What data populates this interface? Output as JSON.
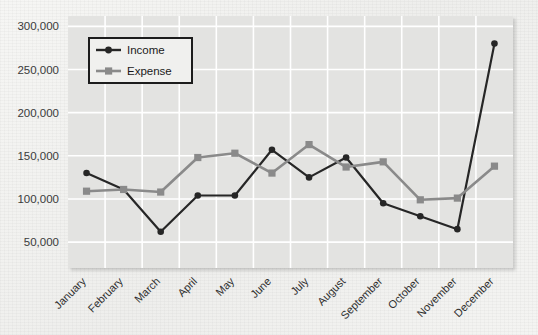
{
  "chart_data": {
    "type": "line",
    "title": "",
    "subtitle": "",
    "xlabel": "",
    "ylabel": "",
    "categories": [
      "January",
      "February",
      "March",
      "April",
      "May",
      "June",
      "July",
      "August",
      "September",
      "October",
      "November",
      "December"
    ],
    "series": [
      {
        "name": "Income",
        "color": "#262626",
        "marker": "circle",
        "values": [
          130000,
          111000,
          62000,
          104000,
          104000,
          157000,
          125000,
          148000,
          95000,
          80000,
          65000,
          280000
        ]
      },
      {
        "name": "Expense",
        "color": "#8a8a8a",
        "marker": "square",
        "values": [
          109000,
          111000,
          108000,
          148000,
          153000,
          130000,
          163000,
          137000,
          143000,
          99000,
          101000,
          138000
        ]
      }
    ],
    "ylim": [
      20000,
      312000
    ],
    "yticks": [
      50000,
      100000,
      150000,
      200000,
      250000,
      300000
    ],
    "ytick_labels": [
      "50,000",
      "100,000",
      "150,000",
      "200,000",
      "250,000",
      "300,000"
    ],
    "grid": true,
    "grid_color": "#ffffff",
    "plot_background": "#e3e3e1",
    "legend_position": "upper-left-inside",
    "legend_entries": [
      "Income",
      "Expense"
    ],
    "xtick_rotation": 45
  }
}
